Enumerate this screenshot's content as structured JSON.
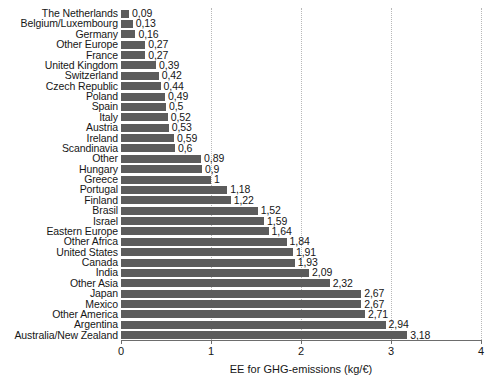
{
  "chart_data": {
    "type": "bar",
    "orientation": "horizontal",
    "title": "",
    "subtitle": "",
    "xlabel": "EE for GHG-emissions (kg/€)",
    "ylabel": "",
    "xlim": [
      0,
      4
    ],
    "xticks": [
      "0",
      "1",
      "2",
      "3",
      "4"
    ],
    "xtick_values": [
      0,
      1,
      2,
      3,
      4
    ],
    "grid": "vertical-dotted",
    "legend": "none",
    "bar_color": "#5c5c5c",
    "decimal_separator": ",",
    "categories": [
      "The Netherlands",
      "Belgium/Luxembourg",
      "Germany",
      "Other Europe",
      "France",
      "United Kingdom",
      "Switzerland",
      "Czech Republic",
      "Poland",
      "Spain",
      "Italy",
      "Austria",
      "Ireland",
      "Scandinavia",
      "Other",
      "Hungary",
      "Greece",
      "Portugal",
      "Finland",
      "Brasil",
      "Israel",
      "Eastern Europe",
      "Other Africa",
      "United States",
      "Canada",
      "India",
      "Other Asia",
      "Japan",
      "Mexico",
      "Other America",
      "Argentina",
      "Australia/New Zealand"
    ],
    "values": [
      0.09,
      0.13,
      0.16,
      0.27,
      0.27,
      0.39,
      0.42,
      0.44,
      0.49,
      0.5,
      0.52,
      0.53,
      0.59,
      0.6,
      0.89,
      0.9,
      1,
      1.18,
      1.22,
      1.52,
      1.59,
      1.64,
      1.84,
      1.91,
      1.93,
      2.09,
      2.32,
      2.67,
      2.67,
      2.71,
      2.94,
      3.18
    ],
    "value_labels": [
      "0,09",
      "0,13",
      "0,16",
      "0,27",
      "0,27",
      "0,39",
      "0,42",
      "0,44",
      "0,49",
      "0,5",
      "0,52",
      "0,53",
      "0,59",
      "0,6",
      "0,89",
      "0,9",
      "1",
      "1,18",
      "1,22",
      "1,52",
      "1,59",
      "1,64",
      "1,84",
      "1,91",
      "1,93",
      "2,09",
      "2,32",
      "2,67",
      "2,67",
      "2,71",
      "2,94",
      "3,18"
    ]
  }
}
